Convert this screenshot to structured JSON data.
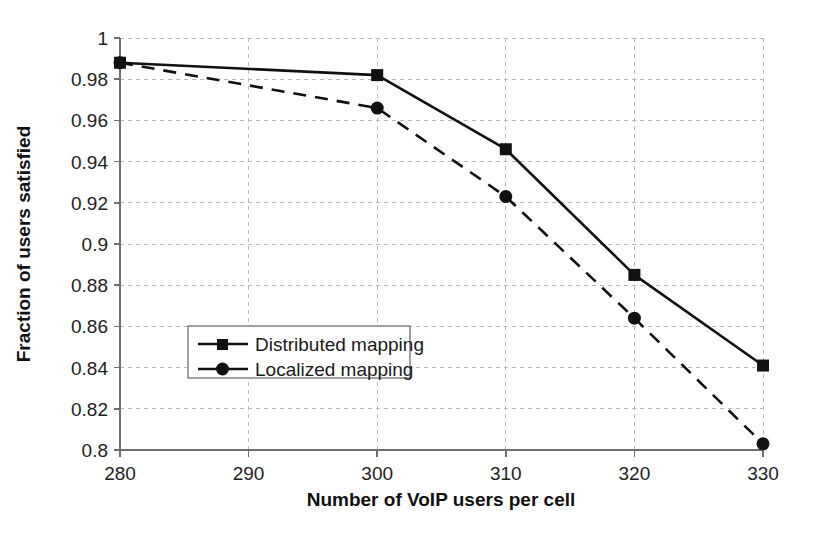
{
  "chart_data": {
    "type": "line",
    "title": "",
    "xlabel": "Number of VoIP users per cell",
    "ylabel": "Fraction of users satisfied",
    "x": [
      280,
      300,
      310,
      320,
      330
    ],
    "xlim": [
      280,
      330
    ],
    "ylim": [
      0.8,
      1.0
    ],
    "xticks": [
      280,
      290,
      300,
      310,
      320,
      330
    ],
    "xtick_labels": [
      "280",
      "290",
      "300",
      "310",
      "320",
      "330"
    ],
    "yticks": [
      0.8,
      0.82,
      0.84,
      0.86,
      0.88,
      0.9,
      0.92,
      0.94,
      0.96,
      0.98,
      1.0
    ],
    "ytick_labels": [
      "0.8",
      "0.82",
      "0.84",
      "0.86",
      "0.88",
      "0.9",
      "0.92",
      "0.94",
      "0.96",
      "0.98",
      "1"
    ],
    "grid": true,
    "legend_position": "center-left-inside",
    "series": [
      {
        "name": "Distributed mapping",
        "marker": "square",
        "linestyle": "solid",
        "color": "#111111",
        "values": [
          0.988,
          0.982,
          0.946,
          0.885,
          0.841
        ]
      },
      {
        "name": "Localized mapping",
        "marker": "circle",
        "linestyle": "dashed",
        "color": "#111111",
        "values": [
          0.988,
          0.966,
          0.923,
          0.864,
          0.803
        ]
      }
    ]
  },
  "axes": {
    "x_title": "Number of VoIP users per cell",
    "y_title": "Fraction of users satisfied"
  },
  "legend": {
    "items": [
      {
        "label": "Distributed mapping",
        "marker": "square"
      },
      {
        "label": "Localized mapping",
        "marker": "circle"
      }
    ]
  },
  "colors": {
    "series": "#111111",
    "grid": "#b9b9b9",
    "axis": "#6f6f6f",
    "background": "#ffffff"
  }
}
